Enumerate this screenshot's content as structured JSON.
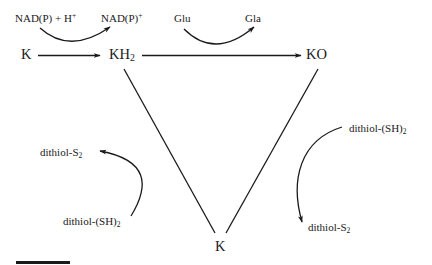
{
  "diagram": {
    "type": "reaction-cycle",
    "nodes": {
      "k_left": {
        "label": "K"
      },
      "kh2": {
        "label": "KH",
        "sub": "2"
      },
      "ko": {
        "label": "KO"
      },
      "k_bottom": {
        "label": "K"
      }
    },
    "cofactors": {
      "nadph_h": {
        "label": "NAD(P) + H",
        "sup": "+"
      },
      "nadp": {
        "label": "NAD(P)",
        "sup": "+"
      },
      "glu": {
        "label": "Glu"
      },
      "gla": {
        "label": "Gla"
      },
      "left_dithiol_s2": {
        "label": "dithiol-S",
        "sub": "2"
      },
      "left_dithiol_sh2": {
        "label": "dithiol-(SH)",
        "sub": "2"
      },
      "right_dithiol_sh2": {
        "label": "dithiol-(SH)",
        "sub": "2"
      },
      "right_dithiol_s2": {
        "label": "dithiol-S",
        "sub": "2"
      }
    },
    "edges": [
      {
        "from": "K",
        "to": "KH2",
        "style": "arrow",
        "cofactor_in": "NAD(P) + H+",
        "cofactor_out": "NAD(P)+"
      },
      {
        "from": "KH2",
        "to": "KO",
        "style": "arrow",
        "cofactor_in": "Glu",
        "cofactor_out": "Gla"
      },
      {
        "from": "KO",
        "to": "K",
        "style": "line",
        "cofactor_in": "dithiol-(SH)2",
        "cofactor_out": "dithiol-S2"
      },
      {
        "from": "K",
        "to": "KH2",
        "style": "line",
        "cofactor_in": "dithiol-(SH)2",
        "cofactor_out": "dithiol-S2"
      }
    ],
    "colors": {
      "stroke": "#1a1a1a",
      "background": "#ffffff"
    },
    "scale_bar": {
      "visible": true
    }
  }
}
